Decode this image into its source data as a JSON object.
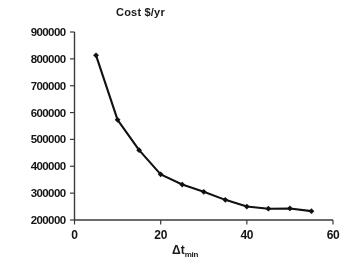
{
  "figure": {
    "width": 347,
    "height": 267,
    "background": "#ffffff",
    "line_color": "#111111",
    "marker_color": "#111111",
    "axis_color": "#3a3a3a",
    "text_color": "#141414"
  },
  "chart_data": {
    "type": "line",
    "title": "Cost $/yr",
    "subtitle": "",
    "xlabel": "Δt",
    "xlabel_sub": "min",
    "ylabel": "Cost $/yr",
    "x": [
      5,
      10,
      15,
      20,
      25,
      30,
      35,
      40,
      45,
      50,
      55
    ],
    "values": [
      813000,
      573000,
      460000,
      370000,
      332000,
      305000,
      275000,
      250000,
      242000,
      243000,
      233000
    ],
    "series": [
      {
        "name": "Total annual cost",
        "values": [
          813000,
          573000,
          460000,
          370000,
          332000,
          305000,
          275000,
          250000,
          242000,
          243000,
          233000
        ]
      }
    ],
    "xlim": [
      0,
      60
    ],
    "ylim": [
      200000,
      900000
    ],
    "xticks": [
      0,
      20,
      40,
      60
    ],
    "yticks": [
      200000,
      300000,
      400000,
      500000,
      600000,
      700000,
      800000,
      900000
    ],
    "xtick_labels": [
      "0",
      "20",
      "40",
      "60"
    ],
    "ytick_labels": [
      "200000",
      "300000",
      "400000",
      "500000",
      "600000",
      "700000",
      "800000",
      "900000"
    ],
    "grid": false,
    "legend": false,
    "legend_position": "none",
    "marker": "diamond",
    "annotations": []
  },
  "axes": {
    "y_title": "Cost $/yr",
    "x_title_base": "Δt",
    "x_title_sub": "min"
  }
}
